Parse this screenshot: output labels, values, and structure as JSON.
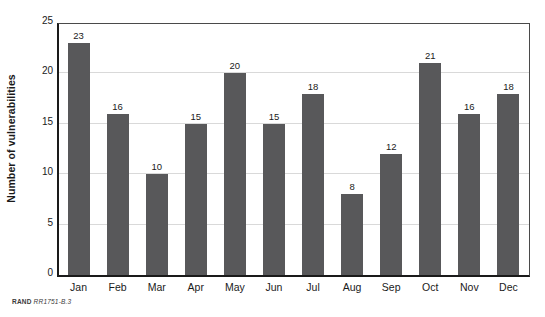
{
  "chart_data": {
    "type": "bar",
    "title": "",
    "subtitle": "",
    "xlabel": "",
    "ylabel": "Number of vulnerabilities",
    "categories": [
      "Jan",
      "Feb",
      "Mar",
      "Apr",
      "May",
      "Jun",
      "Jul",
      "Aug",
      "Sep",
      "Oct",
      "Nov",
      "Dec"
    ],
    "values": [
      23,
      16,
      10,
      15,
      20,
      15,
      18,
      8,
      12,
      21,
      16,
      18
    ],
    "data_labels": [
      "23",
      "16",
      "10",
      "15",
      "20",
      "15",
      "18",
      "8",
      "12",
      "21",
      "16",
      "18"
    ],
    "ylim": [
      0,
      25
    ],
    "yticks": [
      0,
      5,
      10,
      15,
      20,
      25
    ],
    "ytick_labels": [
      "0",
      "5",
      "10",
      "15",
      "20",
      "25"
    ],
    "grid": "horizontal",
    "legend": "none",
    "bar_color": "#58585a",
    "gridline_color": "#d9d9d9",
    "axis_color": "#1a1a1a",
    "background_color": "#ffffff"
  },
  "footer": {
    "org": "RAND",
    "identifier": "RR1751-B.3"
  }
}
